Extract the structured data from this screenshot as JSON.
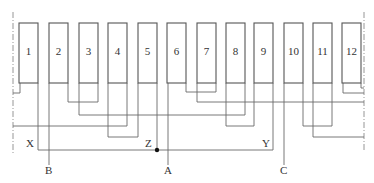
{
  "diagram": {
    "type": "stator-winding-diagram",
    "slots": [
      {
        "number": "1",
        "x": 19
      },
      {
        "number": "2",
        "x": 49
      },
      {
        "number": "3",
        "x": 79
      },
      {
        "number": "4",
        "x": 108
      },
      {
        "number": "5",
        "x": 138
      },
      {
        "number": "6",
        "x": 167
      },
      {
        "number": "7",
        "x": 197
      },
      {
        "number": "8",
        "x": 226
      },
      {
        "number": "9",
        "x": 254
      },
      {
        "number": "10",
        "x": 284
      },
      {
        "number": "11",
        "x": 313
      },
      {
        "number": "12",
        "x": 342
      }
    ],
    "terminal_labels": {
      "X": "X",
      "Y": "Y",
      "Z": "Z",
      "A": "A",
      "B": "B",
      "C": "C"
    },
    "colors": {
      "slot_stroke": "#555555",
      "wire": "#6a6a6a",
      "junction": "#111111"
    }
  }
}
